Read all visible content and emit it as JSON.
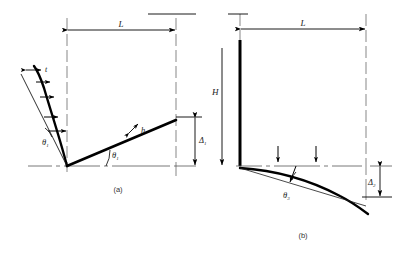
{
  "figure": {
    "panels": [
      {
        "id": "a",
        "caption": "(a)",
        "labels": {
          "span": "L",
          "thickness": "t",
          "beam_depth": "h",
          "angle_top": "θ",
          "angle_top_sub": "1",
          "angle_beam": "θ",
          "angle_beam_sub": "1",
          "deflection": "Δ",
          "deflection_sub": "1"
        }
      },
      {
        "id": "b",
        "caption": "(b)",
        "labels": {
          "span": "L",
          "height": "H",
          "angle_beam": "θ",
          "angle_beam_sub": "3",
          "deflection": "Δ",
          "deflection_sub": "2"
        }
      }
    ],
    "colors": {
      "ink": "#000000",
      "thin_line": "#2b2b2b",
      "centerline": "#444444",
      "caption": "#333333"
    },
    "icons": {
      "load_arrow_horizontal": "arrow-right-icon",
      "load_arrow_vertical": "arrow-down-icon",
      "dimension_arrow": "dimension-arrow-icon",
      "centerline": "center-line-icon"
    }
  }
}
